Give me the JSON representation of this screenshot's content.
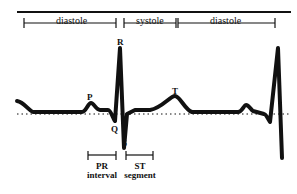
{
  "diagram": {
    "phases": [
      {
        "label": "diastole"
      },
      {
        "label": "systole"
      },
      {
        "label": "diastole"
      }
    ],
    "waves": {
      "p": "P",
      "q": "Q",
      "r": "R",
      "s": "S",
      "t": "T"
    },
    "intervals": [
      {
        "line1": "PR",
        "line2": "interval"
      },
      {
        "line1": "ST",
        "line2": "segment"
      }
    ],
    "colors": {
      "ink": "#111111",
      "background": "#ffffff"
    }
  }
}
